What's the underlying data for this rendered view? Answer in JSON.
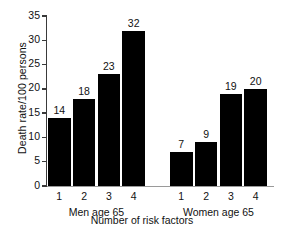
{
  "chart_data": {
    "type": "bar",
    "title": "",
    "xlabel": "Number of risk factors",
    "ylabel": "Death rate/100 persons",
    "ylim": [
      0,
      35
    ],
    "ytick_labels": [
      "0",
      "5",
      "10",
      "15",
      "20",
      "25",
      "30",
      "35"
    ],
    "ytick_values": [
      0,
      5,
      10,
      15,
      20,
      25,
      30,
      35
    ],
    "grid": false,
    "legend": "none",
    "bar_color": "#000000",
    "axis_color": "#3a3a3a",
    "background": "#ffffff",
    "categories": [
      "1",
      "2",
      "3",
      "4"
    ],
    "groups": [
      {
        "name": "Men age 65",
        "categories": [
          "1",
          "2",
          "3",
          "4"
        ],
        "values": [
          14,
          18,
          23,
          32
        ],
        "value_labels": [
          "14",
          "18",
          "23",
          "32"
        ]
      },
      {
        "name": "Women age 65",
        "categories": [
          "1",
          "2",
          "3",
          "4"
        ],
        "values": [
          7,
          9,
          19,
          20
        ],
        "value_labels": [
          "7",
          "9",
          "19",
          "20"
        ]
      }
    ],
    "series": [
      {
        "name": "Men age 65",
        "values": [
          14,
          18,
          23,
          32
        ]
      },
      {
        "name": "Women age 65",
        "values": [
          7,
          9,
          19,
          20
        ]
      }
    ]
  }
}
